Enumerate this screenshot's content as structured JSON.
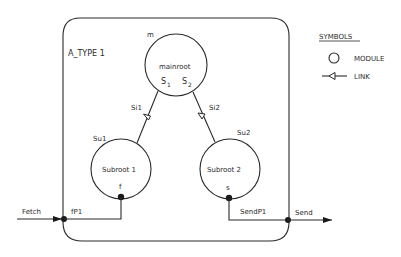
{
  "diagram": {
    "type_label": "A_TYPE 1",
    "modules": [
      {
        "id": "m",
        "name": "mainroot",
        "tag": "m",
        "ports": [
          {
            "label": "S",
            "sub": "1"
          },
          {
            "label": "S",
            "sub": "2"
          }
        ]
      },
      {
        "id": "Su1",
        "name": "Subroot 1",
        "tag": "Su1",
        "port": "f"
      },
      {
        "id": "Su2",
        "name": "Subroot 2",
        "tag": "Su2",
        "port": "s"
      }
    ],
    "links": [
      {
        "label": "Si1",
        "from": "mainroot",
        "to": "Subroot 1"
      },
      {
        "label": "Si2",
        "from": "mainroot",
        "to": "Subroot 2"
      }
    ],
    "external": {
      "input": {
        "label": "Fetch",
        "port": "fP1"
      },
      "output": {
        "label": "Send",
        "port": "SendP1"
      }
    }
  },
  "legend": {
    "title": "SYMBOLS",
    "items": [
      {
        "symbol": "circle",
        "label": "MODULE"
      },
      {
        "symbol": "link-arrow",
        "label": "LINK"
      }
    ]
  },
  "colors": {
    "ink": "#2a2a2a",
    "background": "#ffffff"
  }
}
